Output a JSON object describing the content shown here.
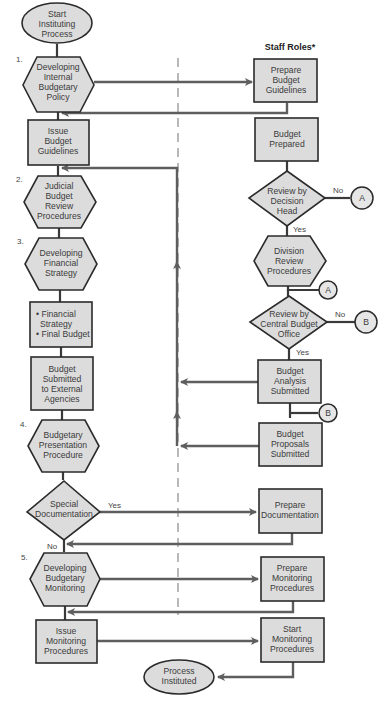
{
  "header": {
    "staff_roles": "Staff Roles*"
  },
  "steps": [
    "1.",
    "2.",
    "3.",
    "4.",
    "5."
  ],
  "left_column": {
    "start": [
      "Start",
      "Instituting",
      "Process"
    ],
    "developing_internal_policy": [
      "Developing",
      "Internal",
      "Budgetary",
      "Policy"
    ],
    "issue_budget_guidelines": [
      "Issue",
      "Budget",
      "Guidelines"
    ],
    "judicial_review": [
      "Judicial",
      "Budget",
      "Review",
      "Procedures"
    ],
    "developing_financial_strategy": [
      "Developing",
      "Financial",
      "Strategy"
    ],
    "strategy_list": [
      "• Financial",
      "  Strategy",
      "• Final Budget"
    ],
    "budget_submitted_external": [
      "Budget",
      "Submitted",
      "to External",
      "Agencies"
    ],
    "presentation_procedure": [
      "Budgetary",
      "Presentation",
      "Procedure"
    ],
    "special_documentation": [
      "Special",
      "Documentation"
    ],
    "developing_monitoring": [
      "Developing",
      "Budgetary",
      "Monitoring"
    ],
    "issue_monitoring": [
      "Issue",
      "Monitoring",
      "Procedures"
    ],
    "end": [
      "Process",
      "Instituted"
    ]
  },
  "right_column": {
    "prepare_guidelines": [
      "Prepare",
      "Budget",
      "Guidelines"
    ],
    "budget_prepared": [
      "Budget",
      "Prepared"
    ],
    "review_decision_head": [
      "Review by",
      "Decision",
      "Head"
    ],
    "division_review": [
      "Division",
      "Review",
      "Procedures"
    ],
    "review_central_office": [
      "Review by",
      "Central Budget",
      "Office"
    ],
    "analysis_submitted": [
      "Budget",
      "Analysis",
      "Submitted"
    ],
    "proposals_submitted": [
      "Budget",
      "Proposals",
      "Submitted"
    ],
    "prepare_documentation": [
      "Prepare",
      "Documentation"
    ],
    "prepare_monitoring": [
      "Prepare",
      "Monitoring",
      "Procedures"
    ],
    "start_monitoring": [
      "Start",
      "Monitoring",
      "Procedures"
    ]
  },
  "decisions": {
    "yes": "Yes",
    "no": "No"
  },
  "connectors": {
    "a": "A",
    "b": "B"
  },
  "colors": {
    "shape_fill": "#dcdcdc",
    "outline": "#2b2b2b",
    "flow_line": "#5e5e5e",
    "divider": "#8a8a8a"
  }
}
